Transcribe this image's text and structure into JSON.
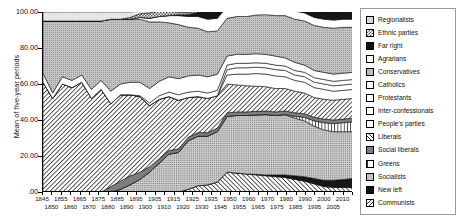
{
  "axes": {
    "y_title": "Mean of five-year periods",
    "y_ticks": [
      "100.00",
      "80.00",
      "60.00",
      "40.00",
      "20.00",
      ".00"
    ],
    "x_ticks_row1": [
      "1845",
      "1855",
      "1865",
      "1875",
      "1885",
      "1895",
      "1905",
      "1915",
      "1925",
      "1935",
      "1950",
      "1960",
      "1970",
      "1980",
      "1990",
      "2000",
      "2010"
    ],
    "x_ticks_row2": [
      "1850",
      "1860",
      "1870",
      "1880",
      "1890",
      "1900",
      "1910",
      "1920",
      "1930",
      "1945",
      "1955",
      "1965",
      "1975",
      "1985",
      "1995",
      "2005"
    ]
  },
  "legend": {
    "items": [
      {
        "label": "Regionalists",
        "pattern": "sw-dot-light",
        "icon": "swatch-dot-light-icon"
      },
      {
        "label": "Ethnic parties",
        "pattern": "sw-checker",
        "icon": "swatch-checker-icon"
      },
      {
        "label": "Far right",
        "pattern": "sw-black",
        "icon": "swatch-black-icon"
      },
      {
        "label": "Agrarians",
        "pattern": "sw-white",
        "icon": "swatch-white-icon"
      },
      {
        "label": "Conservatives",
        "pattern": "sw-dot-mid",
        "icon": "swatch-dot-mid-icon"
      },
      {
        "label": "Catholics",
        "pattern": "sw-white",
        "icon": "swatch-white-icon"
      },
      {
        "label": "Protestants",
        "pattern": "sw-white",
        "icon": "swatch-white-icon"
      },
      {
        "label": "Inter-confessionals",
        "pattern": "sw-white",
        "icon": "swatch-white-icon"
      },
      {
        "label": "People's parties",
        "pattern": "sw-white",
        "icon": "swatch-white-icon"
      },
      {
        "label": "Liberals",
        "pattern": "sw-diag",
        "icon": "swatch-diagonal-icon"
      },
      {
        "label": "Social liberals",
        "pattern": "sw-gray-dark",
        "icon": "swatch-gray-icon"
      },
      {
        "label": "Greens",
        "pattern": "sw-vert",
        "icon": "swatch-vertical-icon"
      },
      {
        "label": "Socialists",
        "pattern": "sw-dot-dense",
        "icon": "swatch-dot-dense-icon"
      },
      {
        "label": "New left",
        "pattern": "sw-black",
        "icon": "swatch-black-icon"
      },
      {
        "label": "Communists",
        "pattern": "sw-backdiag",
        "icon": "swatch-backdiagonal-icon"
      }
    ]
  },
  "chart_data": {
    "type": "area",
    "title": "",
    "xlabel": "",
    "ylabel": "Mean of five-year periods",
    "ylim": [
      0,
      100
    ],
    "xlim": [
      1845,
      2010
    ],
    "grid": false,
    "legend_position": "right",
    "stacking": "stacked",
    "x": [
      1845,
      1850,
      1855,
      1860,
      1865,
      1870,
      1875,
      1880,
      1885,
      1890,
      1895,
      1900,
      1905,
      1910,
      1915,
      1920,
      1925,
      1930,
      1935,
      1945,
      1950,
      1955,
      1960,
      1965,
      1970,
      1975,
      1980,
      1985,
      1990,
      1995,
      2000,
      2005,
      2010
    ],
    "series": [
      {
        "name": "Communists",
        "pattern": "sw-backdiag",
        "values": [
          0,
          0,
          0,
          0,
          0,
          0,
          0,
          0,
          0,
          0,
          0,
          0,
          0,
          0,
          0,
          1.5,
          3.5,
          4.0,
          5.5,
          11.0,
          10.5,
          10.0,
          9.5,
          9.0,
          8.5,
          8.0,
          7.0,
          6.0,
          4.5,
          3.0,
          2.5,
          2.5,
          2.5
        ]
      },
      {
        "name": "New left",
        "pattern": "sw-black",
        "values": [
          0,
          0,
          0,
          0,
          0,
          0,
          0,
          0,
          0,
          0,
          0,
          0,
          0,
          0,
          0,
          0,
          0,
          0,
          0,
          0,
          0,
          0,
          0.3,
          0.5,
          1.0,
          1.5,
          2.0,
          2.5,
          3.0,
          3.5,
          4.0,
          4.5,
          5.0
        ]
      },
      {
        "name": "Socialists",
        "pattern": "sw-dot-dense",
        "values": [
          0,
          0,
          0,
          0,
          0,
          0,
          0,
          0,
          1.5,
          4.0,
          7.0,
          11.0,
          16.0,
          21.0,
          22.0,
          27.0,
          27.5,
          27.0,
          28.0,
          31.0,
          32.0,
          32.5,
          33.0,
          33.5,
          33.0,
          33.5,
          32.0,
          31.0,
          29.0,
          28.0,
          27.0,
          26.5,
          26.0
        ]
      },
      {
        "name": "Greens",
        "pattern": "sw-vert",
        "values": [
          0,
          0,
          0,
          0,
          0,
          0,
          0,
          0,
          0,
          0,
          0,
          0,
          0,
          0,
          0,
          0,
          0,
          0,
          0,
          0,
          0,
          0,
          0,
          0,
          0,
          0,
          1.0,
          2.0,
          3.0,
          4.0,
          4.5,
          5.0,
          5.5
        ]
      },
      {
        "name": "Social liberals",
        "pattern": "sw-gray-dark",
        "values": [
          0,
          0,
          0,
          0,
          0,
          0,
          0,
          3.0,
          4.5,
          5.0,
          4.0,
          3.0,
          2.5,
          2.0,
          2.0,
          2.0,
          2.0,
          2.0,
          2.0,
          2.0,
          2.0,
          2.0,
          2.0,
          2.0,
          2.0,
          2.0,
          2.0,
          2.0,
          2.0,
          2.0,
          2.0,
          2.0,
          2.0
        ]
      },
      {
        "name": "Liberals",
        "pattern": "sw-diag",
        "values": [
          61.0,
          52.0,
          60.0,
          58.0,
          61.0,
          52.0,
          57.0,
          46.0,
          48.0,
          45.0,
          42.0,
          34.0,
          33.0,
          30.0,
          27.0,
          22.0,
          20.0,
          19.0,
          18.0,
          16.0,
          15.0,
          14.5,
          14.0,
          13.5,
          13.0,
          12.5,
          12.0,
          11.5,
          11.0,
          11.0,
          11.0,
          11.0,
          11.0
        ]
      },
      {
        "name": "People's parties",
        "pattern": "sw-white",
        "values": [
          0,
          0,
          0,
          0,
          0,
          0,
          0,
          0,
          0,
          0,
          0,
          0,
          0,
          0,
          0,
          0,
          0,
          0,
          0,
          5.0,
          6.0,
          6.5,
          7.0,
          7.0,
          7.0,
          6.5,
          6.0,
          6.0,
          5.5,
          5.5,
          5.0,
          5.0,
          5.0
        ]
      },
      {
        "name": "Inter-confessionals",
        "pattern": "sw-white",
        "values": [
          0,
          0,
          0,
          0,
          0,
          0,
          0,
          0,
          0,
          0,
          0,
          0,
          0,
          0,
          0,
          0,
          0,
          0,
          0,
          3.0,
          3.5,
          3.5,
          3.5,
          3.5,
          3.5,
          3.5,
          3.0,
          3.0,
          3.0,
          3.0,
          3.0,
          3.0,
          3.0
        ]
      },
      {
        "name": "Protestants",
        "pattern": "sw-white",
        "values": [
          0,
          0,
          0,
          0,
          0,
          0,
          0,
          0,
          0,
          0,
          0.5,
          1.5,
          2.0,
          2.5,
          3.0,
          3.0,
          3.0,
          3.0,
          3.0,
          2.5,
          2.5,
          2.5,
          2.5,
          2.5,
          2.5,
          2.5,
          2.5,
          2.5,
          2.5,
          2.5,
          2.5,
          2.5,
          2.5
        ]
      },
      {
        "name": "Catholics",
        "pattern": "sw-white",
        "values": [
          5.0,
          3.0,
          4.0,
          4.0,
          4.0,
          5.0,
          5.0,
          7.0,
          6.0,
          7.0,
          7.5,
          8.0,
          8.0,
          8.5,
          9.0,
          9.0,
          9.0,
          9.0,
          9.0,
          5.0,
          5.0,
          5.0,
          5.0,
          5.0,
          5.0,
          4.5,
          4.5,
          4.0,
          4.0,
          4.0,
          4.0,
          4.0,
          4.0
        ]
      },
      {
        "name": "Conservatives",
        "pattern": "sw-dot-mid",
        "values": [
          29.0,
          40.0,
          31.0,
          33.0,
          30.0,
          38.0,
          33.0,
          40.0,
          36.0,
          35.0,
          35.0,
          37.0,
          33.0,
          30.0,
          30.0,
          27.0,
          26.0,
          25.0,
          24.0,
          21.0,
          21.0,
          21.0,
          21.5,
          22.0,
          22.5,
          23.5,
          24.0,
          24.5,
          25.0,
          25.0,
          25.5,
          25.5,
          25.0
        ]
      },
      {
        "name": "Agrarians",
        "pattern": "sw-white",
        "values": [
          0,
          0,
          0,
          0,
          0,
          0,
          0,
          0,
          0,
          0,
          1.0,
          2.0,
          3.0,
          4.0,
          5.0,
          6.0,
          6.5,
          7.0,
          7.0,
          6.5,
          6.0,
          6.0,
          5.5,
          5.0,
          5.0,
          5.0,
          4.5,
          4.5,
          4.5,
          4.5,
          4.5,
          4.5,
          4.5
        ]
      },
      {
        "name": "Far right",
        "pattern": "sw-black",
        "values": [
          0,
          0,
          0,
          0,
          0,
          0,
          0,
          0,
          0,
          0,
          0,
          0,
          0,
          0,
          0.5,
          1.0,
          2.5,
          4.5,
          5.5,
          0.5,
          0.5,
          0.5,
          0.5,
          0.5,
          0.5,
          0.8,
          1.5,
          2.5,
          3.5,
          4.0,
          4.5,
          4.5,
          5.0
        ]
      },
      {
        "name": "Ethnic parties",
        "pattern": "sw-checker",
        "values": [
          0,
          0,
          0,
          0,
          0,
          0,
          0,
          0,
          0,
          1.0,
          2.0,
          3.0,
          3.0,
          2.5,
          1.5,
          1.0,
          1.0,
          1.0,
          1.0,
          0.5,
          0.5,
          0.5,
          0.5,
          0.5,
          0.5,
          0.5,
          0.5,
          0.5,
          0.5,
          0.5,
          0.5,
          0.5,
          0.5
        ]
      },
      {
        "name": "Regionalists",
        "pattern": "sw-dot-light",
        "values": [
          5.0,
          5.0,
          5.0,
          5.0,
          5.0,
          5.0,
          5.0,
          4.0,
          4.0,
          3.0,
          1.5,
          1.0,
          0.5,
          0.5,
          0.5,
          0.5,
          0.5,
          0.5,
          0.5,
          0.5,
          0.5,
          0.5,
          0.5,
          0.5,
          0.5,
          0.5,
          0.5,
          0.5,
          0.5,
          0.5,
          0.5,
          0.5,
          0.5
        ]
      }
    ]
  }
}
